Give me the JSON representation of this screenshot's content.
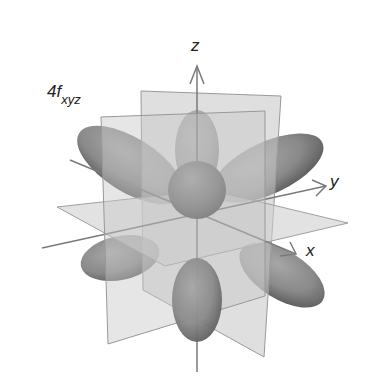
{
  "figure": {
    "title_main": "4f",
    "title_subscript": "xyz",
    "axes": {
      "x": "x",
      "y": "y",
      "z": "z"
    },
    "colors": {
      "lobe": "#8a8a8a",
      "lobe_dark": "#5e5e5e",
      "plane": "#bdbdbd",
      "axis": "#7a7a7a",
      "text": "#222222",
      "background": "#ffffff"
    }
  }
}
